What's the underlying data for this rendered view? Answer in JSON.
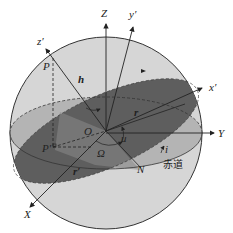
{
  "diagram": {
    "colors": {
      "sphere_light": "#d4d4d4",
      "sphere_mid": "#a8a8a8",
      "orbit_plane_dark": "#5a5a5a",
      "line": "#222222",
      "background": "#ffffff"
    },
    "labels": {
      "Z": "Z",
      "y_prime": "y′",
      "z_prime": "z′",
      "x_prime": "x′",
      "Y": "Y",
      "X": "X",
      "P": "P",
      "P_prime": "P′",
      "h": "h",
      "O": "O",
      "r": "r",
      "r_prime": "r′",
      "u": "u",
      "Omega": "Ω",
      "i": "i",
      "N": "N",
      "equator": "赤道"
    }
  }
}
